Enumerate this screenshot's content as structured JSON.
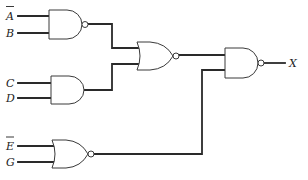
{
  "diagram": {
    "type": "logic-circuit",
    "inputs": [
      {
        "id": "A",
        "label": "A",
        "inverted": true
      },
      {
        "id": "B",
        "label": "B",
        "inverted": false
      },
      {
        "id": "C",
        "label": "C",
        "inverted": false
      },
      {
        "id": "D",
        "label": "D",
        "inverted": false
      },
      {
        "id": "E",
        "label": "E",
        "inverted": true
      },
      {
        "id": "G",
        "label": "G",
        "inverted": false
      }
    ],
    "output": {
      "id": "X",
      "label": "X"
    },
    "gates": [
      {
        "id": "g1",
        "type": "NAND",
        "inputs": [
          "A_bar",
          "B"
        ]
      },
      {
        "id": "g2",
        "type": "AND",
        "inputs": [
          "C",
          "D"
        ]
      },
      {
        "id": "g3",
        "type": "NOR",
        "inputs": [
          "g1",
          "g2"
        ]
      },
      {
        "id": "g4",
        "type": "NOR",
        "inputs": [
          "E_bar",
          "G"
        ]
      },
      {
        "id": "g5",
        "type": "NAND",
        "inputs": [
          "g3",
          "g4"
        ],
        "output": "X"
      }
    ],
    "colors": {
      "line": "#2a2a2a",
      "background": "#ffffff"
    }
  }
}
